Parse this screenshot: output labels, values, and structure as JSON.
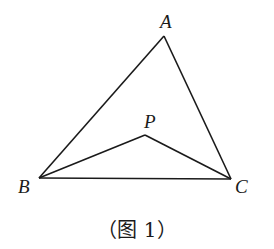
{
  "figure": {
    "points": {
      "A": {
        "label": "A",
        "x": 164,
        "y": 36
      },
      "B": {
        "label": "B",
        "x": 39,
        "y": 178
      },
      "C": {
        "label": "C",
        "x": 231,
        "y": 179
      },
      "P": {
        "label": "P",
        "x": 145,
        "y": 135
      }
    },
    "segments": [
      "AB",
      "AC",
      "BC",
      "PB",
      "PC"
    ],
    "caption": "（图 1）",
    "line_color": "#1a1a1a"
  }
}
